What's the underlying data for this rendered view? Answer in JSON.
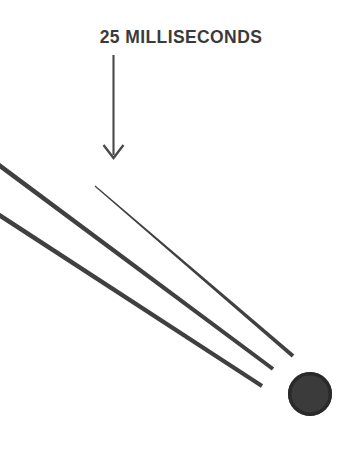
{
  "figure": {
    "width": 346,
    "height": 453,
    "background_color": "#ffffff",
    "caption_text": "25 MILLISECONDS",
    "caption_color": "#3a3a3a"
  },
  "annotation": {
    "label": "25 MILLISECONDS",
    "arrow_name": "down-arrow-icon",
    "arrow_color": "#4a4a4a",
    "arrow_line_x": 113.5,
    "arrow_line_top": 55,
    "arrow_line_bottom": 158,
    "arrow_head_half_width": 10,
    "arrow_head_height": 13
  },
  "motion_trails": {
    "color": "#3f3f3f",
    "count": 3,
    "streaks": [
      {
        "name": "motion-streak-top",
        "x1": 95,
        "y1": 186,
        "x2": 293,
        "y2": 356,
        "width_start": 1.2,
        "width_end": 4.0
      },
      {
        "name": "motion-streak-middle",
        "x1": -4,
        "y1": 163,
        "x2": 273,
        "y2": 369,
        "width_start": 4.6,
        "width_end": 4.0
      },
      {
        "name": "motion-streak-bottom",
        "x1": -4,
        "y1": 213,
        "x2": 262,
        "y2": 386,
        "width_start": 4.6,
        "width_end": 4.0
      }
    ]
  },
  "ball": {
    "name": "moving-ball",
    "center_x": 310,
    "center_y": 394,
    "radius": 22,
    "fill_color": "#3b3b3b",
    "ring_color": "#2b2b2b",
    "ring_width": 3.5
  }
}
